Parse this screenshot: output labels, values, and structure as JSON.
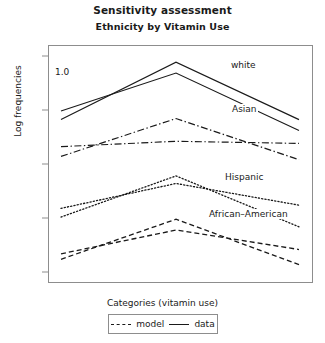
{
  "chart_data": {
    "type": "line",
    "title": "Sensitivity assessment",
    "subtitle": "Ethnicity by Vitamin Use",
    "xlabel": "Categories (vitamin use)",
    "ylabel": "Log frequencies",
    "categories": [
      "always",
      "during",
      "never"
    ],
    "ylim": [
      2.42,
      4.6
    ],
    "yticks": [
      "4.5",
      "4.0",
      "3.5",
      "3.0",
      "2.5"
    ],
    "ytick_values": [
      4.5,
      4.0,
      3.5,
      3.0,
      2.5
    ],
    "grid": false,
    "legend_position": "bottom",
    "annotation": "1.0",
    "group_labels": [
      "white",
      "Asian",
      "Hispanic",
      "African–American"
    ],
    "series": [
      {
        "name": "white data",
        "group": "white",
        "kind": "data",
        "style": "solid",
        "values": [
          3.92,
          4.45,
          3.92
        ]
      },
      {
        "name": "white model",
        "group": "white",
        "kind": "model",
        "style": "solid",
        "values": [
          4.0,
          4.35,
          3.82
        ]
      },
      {
        "name": "Asian data",
        "group": "Asian",
        "kind": "data",
        "style": "dashdot",
        "values": [
          3.58,
          3.93,
          3.55
        ]
      },
      {
        "name": "Asian model",
        "group": "Asian",
        "kind": "model",
        "style": "dashdot",
        "values": [
          3.67,
          3.72,
          3.7
        ]
      },
      {
        "name": "Hispanic data",
        "group": "Hispanic",
        "kind": "data",
        "style": "dot",
        "values": [
          3.02,
          3.4,
          2.93
        ]
      },
      {
        "name": "Hispanic model",
        "group": "Hispanic",
        "kind": "model",
        "style": "dot",
        "values": [
          3.1,
          3.33,
          3.13
        ]
      },
      {
        "name": "African-American data",
        "group": "African–American",
        "kind": "data",
        "style": "dash",
        "values": [
          2.63,
          3.0,
          2.58
        ]
      },
      {
        "name": "African-American model",
        "group": "African–American",
        "kind": "model",
        "style": "dash",
        "values": [
          2.68,
          2.9,
          2.72
        ]
      }
    ],
    "legend": [
      {
        "label": "model",
        "style": "dashed"
      },
      {
        "label": "data",
        "style": "solid"
      }
    ]
  },
  "labels": {
    "title": "Sensitivity assessment",
    "subtitle": "Ethnicity by Vitamin Use",
    "ylabel": "Log frequencies",
    "xlabel": "Categories (vitamin use)",
    "annotation": "1.0",
    "ytick_0": "4.5",
    "ytick_1": "4.0",
    "ytick_2": "3.5",
    "ytick_3": "3.0",
    "ytick_4": "2.5",
    "xtick_0": "always",
    "xtick_1": "during",
    "xtick_2": "never",
    "group_white": "white",
    "group_asian": "Asian",
    "group_hispanic": "Hispanic",
    "group_african_american": "African–American",
    "legend_model": "model",
    "legend_data": "data"
  },
  "colors": {
    "ink": "#1a1a1a",
    "frame": "#8d8d8d",
    "background": "#ffffff"
  }
}
